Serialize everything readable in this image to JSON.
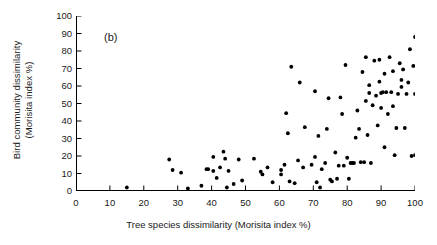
{
  "figure": {
    "panel_label": "(b)",
    "background_color": "#ffffff",
    "marker_color": "#000000",
    "axis_color": "#000000"
  },
  "chart_data": {
    "type": "scatter",
    "title": "",
    "panel": "(b)",
    "xlabel": "Tree species dissimilarity (Morisita index %)",
    "ylabel": "Bird community dissimilarity (Morisita index %)",
    "ylabel_line1": "Bird community dissimilarity",
    "ylabel_line2": "(Morisita index %)",
    "xlim": [
      0,
      100
    ],
    "ylim": [
      0,
      100
    ],
    "xticks": [
      0,
      10,
      20,
      30,
      40,
      50,
      60,
      70,
      80,
      90,
      100
    ],
    "yticks": [
      0,
      10,
      20,
      30,
      40,
      50,
      60,
      70,
      80,
      90,
      100
    ],
    "xtick_labels": [
      "0",
      "10",
      "20",
      "30",
      "40",
      "50",
      "60",
      "70",
      "80",
      "90",
      "100"
    ],
    "ytick_labels": [
      "0",
      "10",
      "20",
      "30",
      "40",
      "50",
      "60",
      "70",
      "80",
      "90",
      "100"
    ],
    "grid": false,
    "legend": null,
    "marker": "filled-circle",
    "marker_size": 3,
    "series": [
      {
        "name": "site pairs",
        "points": [
          [
            15.0,
            2.0
          ],
          [
            27.5,
            18.0
          ],
          [
            28.5,
            12.0
          ],
          [
            31.0,
            10.5
          ],
          [
            33.0,
            1.5
          ],
          [
            37.0,
            3.0
          ],
          [
            38.5,
            12.5
          ],
          [
            39.0,
            12.5
          ],
          [
            40.5,
            11.5
          ],
          [
            40.5,
            19.5
          ],
          [
            41.5,
            7.5
          ],
          [
            42.5,
            13.5
          ],
          [
            43.5,
            22.5
          ],
          [
            44.0,
            18.5
          ],
          [
            44.5,
            2.0
          ],
          [
            45.0,
            11.5
          ],
          [
            46.5,
            4.0
          ],
          [
            48.0,
            18.0
          ],
          [
            49.0,
            6.0
          ],
          [
            52.5,
            18.5
          ],
          [
            54.5,
            11.0
          ],
          [
            55.0,
            9.5
          ],
          [
            56.5,
            13.5
          ],
          [
            58.0,
            5.0
          ],
          [
            60.5,
            12.0
          ],
          [
            60.5,
            9.5
          ],
          [
            61.5,
            15.0
          ],
          [
            62.0,
            44.5
          ],
          [
            62.5,
            33.0
          ],
          [
            63.0,
            5.5
          ],
          [
            63.5,
            71.0
          ],
          [
            64.5,
            4.5
          ],
          [
            65.5,
            17.5
          ],
          [
            66.0,
            62.0
          ],
          [
            67.0,
            13.5
          ],
          [
            67.5,
            36.5
          ],
          [
            69.5,
            15.0
          ],
          [
            70.5,
            19.5
          ],
          [
            70.5,
            57.0
          ],
          [
            71.0,
            5.0
          ],
          [
            71.5,
            31.5
          ],
          [
            72.0,
            2.0
          ],
          [
            72.5,
            12.5
          ],
          [
            73.5,
            16.0
          ],
          [
            74.0,
            35.5
          ],
          [
            74.5,
            53.0
          ],
          [
            75.0,
            6.5
          ],
          [
            75.5,
            5.5
          ],
          [
            76.5,
            22.0
          ],
          [
            77.0,
            7.0
          ],
          [
            77.5,
            14.5
          ],
          [
            78.0,
            53.5
          ],
          [
            78.5,
            44.0
          ],
          [
            79.0,
            14.5
          ],
          [
            79.5,
            72.0
          ],
          [
            80.0,
            19.0
          ],
          [
            80.5,
            7.0
          ],
          [
            81.0,
            16.0
          ],
          [
            81.5,
            16.0
          ],
          [
            82.0,
            16.0
          ],
          [
            82.5,
            30.5
          ],
          [
            83.0,
            46.0
          ],
          [
            83.5,
            35.5
          ],
          [
            84.0,
            16.5
          ],
          [
            84.5,
            68.0
          ],
          [
            85.0,
            16.5
          ],
          [
            85.5,
            51.5
          ],
          [
            85.5,
            76.5
          ],
          [
            86.0,
            32.0
          ],
          [
            86.5,
            56.0
          ],
          [
            86.5,
            60.5
          ],
          [
            87.0,
            16.0
          ],
          [
            87.5,
            49.0
          ],
          [
            88.0,
            74.5
          ],
          [
            88.5,
            54.5
          ],
          [
            89.0,
            37.5
          ],
          [
            89.5,
            62.5
          ],
          [
            89.5,
            75.0
          ],
          [
            90.0,
            47.5
          ],
          [
            90.0,
            56.0
          ],
          [
            90.5,
            56.5
          ],
          [
            91.0,
            25.0
          ],
          [
            91.0,
            67.0
          ],
          [
            91.5,
            56.5
          ],
          [
            92.0,
            44.0
          ],
          [
            92.5,
            76.5
          ],
          [
            93.0,
            56.5
          ],
          [
            93.5,
            48.5
          ],
          [
            93.5,
            68.5
          ],
          [
            94.0,
            20.5
          ],
          [
            94.5,
            36.0
          ],
          [
            95.0,
            55.5
          ],
          [
            95.5,
            73.0
          ],
          [
            96.0,
            63.5
          ],
          [
            96.0,
            59.5
          ],
          [
            96.5,
            69.5
          ],
          [
            97.0,
            36.0
          ],
          [
            97.5,
            55.5
          ],
          [
            98.0,
            62.0
          ],
          [
            98.5,
            81.0
          ],
          [
            99.0,
            20.0
          ],
          [
            99.5,
            71.5
          ],
          [
            100.0,
            20.5
          ],
          [
            100.0,
            55.5
          ],
          [
            100.0,
            88.0
          ]
        ]
      }
    ]
  }
}
